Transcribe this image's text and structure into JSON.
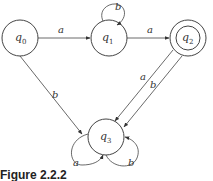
{
  "diagram": {
    "type": "finite-automaton",
    "states": [
      {
        "id": "q0",
        "label": "q",
        "sub": "0",
        "cx": 20,
        "cy": 38,
        "r": 18,
        "accepting": false
      },
      {
        "id": "q1",
        "label": "q",
        "sub": "1",
        "cx": 109,
        "cy": 38,
        "r": 18,
        "accepting": false
      },
      {
        "id": "q2",
        "label": "q",
        "sub": "2",
        "cx": 188,
        "cy": 38,
        "r": 18,
        "accepting": true
      },
      {
        "id": "q3",
        "label": "q",
        "sub": "3",
        "cx": 106,
        "cy": 137,
        "r": 18,
        "accepting": false
      }
    ],
    "transitions": [
      {
        "from": "q0",
        "to": "q1",
        "label": "a"
      },
      {
        "from": "q1",
        "to": "q1",
        "label": "b"
      },
      {
        "from": "q1",
        "to": "q2",
        "label": "a"
      },
      {
        "from": "q0",
        "to": "q3",
        "label": "b"
      },
      {
        "from": "q2",
        "to": "q3",
        "label": "a"
      },
      {
        "from": "q2",
        "to": "q3",
        "label": "b"
      },
      {
        "from": "q3",
        "to": "q3",
        "label": "a"
      },
      {
        "from": "q3",
        "to": "q3",
        "label": "b"
      }
    ]
  },
  "labels": {
    "q0": "q",
    "q0_sub": "0",
    "q1": "q",
    "q1_sub": "1",
    "q2": "q",
    "q2_sub": "2",
    "q3": "q",
    "q3_sub": "3",
    "e_q0_q1": "a",
    "e_q1_loop": "b",
    "e_q1_q2": "a",
    "e_q0_q3": "b",
    "e_q2_q3_a": "a",
    "e_q2_q3_b": "b",
    "e_q3_loop_a": "a",
    "e_q3_loop_b": "b"
  },
  "caption": "Figure 2.2.2"
}
